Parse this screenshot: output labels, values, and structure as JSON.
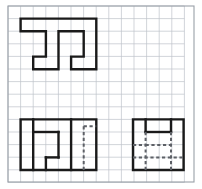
{
  "sheet": {
    "title": "Orthographic Projection Worksheet",
    "width": 202,
    "height": 189,
    "background_color": "#ffffff"
  },
  "grid": {
    "name": "graph-paper-grid",
    "origin_x": 8,
    "origin_y": 6,
    "cell_size": 12.6,
    "columns": 14,
    "rows": 14,
    "line_color": "#bfc3ca",
    "line_width": 0.7
  },
  "border": {
    "name": "sheet-border",
    "x": 8,
    "y": 6,
    "width": 186,
    "height": 176,
    "color": "#9aa0a8",
    "line_width": 1.1
  },
  "style": {
    "solid_color": "#1a1a1a",
    "solid_width": 2.4,
    "hidden_color": "#5d6066",
    "hidden_width": 2.0,
    "hidden_dash": "3.2 2.6"
  },
  "views": [
    {
      "name": "top-view",
      "label": "Top View",
      "outline": "M 20.6 18.6 L 96.3 18.6 L 96.3 69.2 L 71.1 69.2 L 71.1 56.6 L 83.7 56.6 L 83.7 31.2 L 58.5 31.2 L 58.5 69.2 L 33.2 69.2 L 33.2 56.6 L 45.9 56.6 L 45.9 31.2 L 20.6 31.2 Z",
      "hidden_lines": []
    },
    {
      "name": "front-view",
      "label": "Front View",
      "outline": "M 20.6 119.4 L 96.3 119.4 L 96.3 170.0 L 20.6 170.0 Z",
      "interior_solid": [
        "M 33.2 119.4 L 33.2 170.0",
        "M 33.2 132.0 L 58.5 132.0",
        "M 58.5 132.0 L 58.5 157.4",
        "M 58.5 157.4 L 45.9 157.4",
        "M 45.9 157.4 L 45.9 170.0",
        "M 71.1 119.4 L 71.1 170.0"
      ],
      "hidden_lines": [
        "M 83.7 126.2 L 83.7 170.0",
        "M 83.7 126.2 L 96.3 126.2"
      ]
    },
    {
      "name": "side-view",
      "label": "Side View",
      "outline": "M 133.0 119.4 L 183.6 119.4 L 183.6 170.0 L 133.0 170.0 Z",
      "interior_solid": [
        "M 145.6 119.4 L 145.6 132.0",
        "M 145.6 132.0 L 171.0 132.0",
        "M 171.0 119.4 L 171.0 132.0"
      ],
      "hidden_lines": [
        "M 145.6 132.0 L 145.6 170.0",
        "M 171.0 132.0 L 171.0 170.0",
        "M 133.0 145.0 L 145.6 145.0",
        "M 133.0 157.4 L 183.6 157.4",
        "M 145.6 145.0 L 171.0 145.0"
      ]
    }
  ]
}
